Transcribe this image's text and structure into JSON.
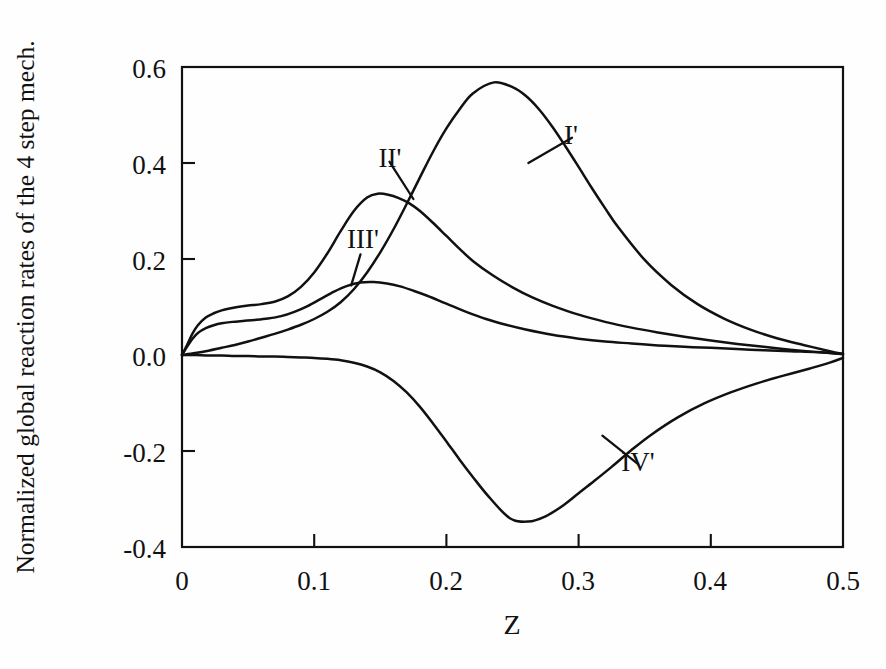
{
  "figure": {
    "background_color": "#fefefe",
    "ink_color": "#111111"
  },
  "axes": {
    "y_title": "Normalized global reaction rates of the 4 step mech.",
    "x_title": "Z",
    "y_ticks": [
      "0.6",
      "0.4",
      "0.2",
      "0.0",
      "-0.2",
      "-0.4"
    ],
    "x_ticks": [
      "0",
      "0.1",
      "0.2",
      "0.3",
      "0.4",
      "0.5"
    ]
  },
  "series_labels": {
    "one": "I'",
    "two": "II'",
    "three": "III'",
    "four": "IV'"
  },
  "chart_data": {
    "type": "line",
    "title": "",
    "subtitle": "",
    "xlabel": "Z",
    "ylabel": "Normalized global reaction rates of the 4 step mech.",
    "xlim": [
      0.0,
      0.5
    ],
    "ylim": [
      -0.4,
      0.6
    ],
    "xticks": [
      0.0,
      0.1,
      0.2,
      0.3,
      0.4,
      0.5
    ],
    "yticks": [
      -0.4,
      -0.2,
      0.0,
      0.2,
      0.4,
      0.6
    ],
    "grid": false,
    "legend": "inline-annotations",
    "annotations": [
      {
        "text": "I'",
        "x": 0.295,
        "y": 0.465,
        "points_to": {
          "x": 0.262,
          "y": 0.4
        }
      },
      {
        "text": "II'",
        "x": 0.157,
        "y": 0.415,
        "points_to": {
          "x": 0.175,
          "y": 0.325
        }
      },
      {
        "text": "III'",
        "x": 0.135,
        "y": 0.222,
        "points_to": {
          "x": 0.128,
          "y": 0.145
        }
      },
      {
        "text": "IV'",
        "x": 0.345,
        "y": -0.215,
        "points_to": {
          "x": 0.318,
          "y": -0.168
        }
      }
    ],
    "series": [
      {
        "name": "I'",
        "peak": {
          "x": 0.236,
          "y": 0.568
        },
        "x": [
          0.0,
          0.01,
          0.02,
          0.03,
          0.04,
          0.05,
          0.06,
          0.07,
          0.08,
          0.09,
          0.1,
          0.11,
          0.12,
          0.13,
          0.14,
          0.15,
          0.16,
          0.17,
          0.18,
          0.19,
          0.2,
          0.21,
          0.22,
          0.236,
          0.25,
          0.26,
          0.27,
          0.28,
          0.29,
          0.3,
          0.31,
          0.32,
          0.33,
          0.35,
          0.37,
          0.39,
          0.41,
          0.43,
          0.45,
          0.47,
          0.49,
          0.5
        ],
        "y": [
          0.0,
          0.004,
          0.009,
          0.015,
          0.021,
          0.028,
          0.036,
          0.044,
          0.053,
          0.063,
          0.075,
          0.09,
          0.11,
          0.137,
          0.172,
          0.214,
          0.262,
          0.315,
          0.37,
          0.424,
          0.472,
          0.512,
          0.545,
          0.568,
          0.558,
          0.54,
          0.512,
          0.476,
          0.435,
          0.392,
          0.348,
          0.306,
          0.266,
          0.198,
          0.146,
          0.106,
          0.076,
          0.053,
          0.035,
          0.021,
          0.008,
          0.002
        ]
      },
      {
        "name": "II'",
        "peak": {
          "x": 0.148,
          "y": 0.336
        },
        "x": [
          0.0,
          0.004,
          0.008,
          0.012,
          0.018,
          0.024,
          0.03,
          0.036,
          0.042,
          0.05,
          0.06,
          0.07,
          0.08,
          0.09,
          0.1,
          0.11,
          0.12,
          0.13,
          0.14,
          0.148,
          0.156,
          0.164,
          0.172,
          0.18,
          0.19,
          0.2,
          0.21,
          0.22,
          0.235,
          0.25,
          0.265,
          0.28,
          0.3,
          0.32,
          0.34,
          0.36,
          0.38,
          0.4,
          0.42,
          0.44,
          0.46,
          0.48,
          0.5
        ],
        "y": [
          0.0,
          0.022,
          0.045,
          0.062,
          0.078,
          0.087,
          0.093,
          0.097,
          0.1,
          0.103,
          0.106,
          0.111,
          0.122,
          0.142,
          0.172,
          0.212,
          0.258,
          0.3,
          0.328,
          0.336,
          0.334,
          0.327,
          0.316,
          0.3,
          0.275,
          0.248,
          0.221,
          0.196,
          0.166,
          0.141,
          0.12,
          0.103,
          0.084,
          0.069,
          0.057,
          0.047,
          0.038,
          0.03,
          0.023,
          0.017,
          0.011,
          0.006,
          0.002
        ]
      },
      {
        "name": "III'",
        "peak": {
          "x": 0.135,
          "y": 0.151
        },
        "x": [
          0.0,
          0.004,
          0.008,
          0.012,
          0.018,
          0.024,
          0.03,
          0.038,
          0.046,
          0.055,
          0.065,
          0.075,
          0.085,
          0.095,
          0.105,
          0.115,
          0.125,
          0.135,
          0.145,
          0.155,
          0.165,
          0.175,
          0.185,
          0.2,
          0.215,
          0.23,
          0.245,
          0.26,
          0.28,
          0.3,
          0.32,
          0.34,
          0.36,
          0.38,
          0.4,
          0.43,
          0.46,
          0.48,
          0.5
        ],
        "y": [
          0.0,
          0.018,
          0.034,
          0.046,
          0.056,
          0.062,
          0.066,
          0.069,
          0.071,
          0.073,
          0.076,
          0.081,
          0.09,
          0.102,
          0.117,
          0.132,
          0.144,
          0.151,
          0.152,
          0.149,
          0.143,
          0.134,
          0.124,
          0.107,
          0.09,
          0.075,
          0.063,
          0.053,
          0.042,
          0.034,
          0.028,
          0.024,
          0.02,
          0.017,
          0.015,
          0.011,
          0.008,
          0.006,
          0.002
        ]
      },
      {
        "name": "IV'",
        "minimum": {
          "x": 0.248,
          "y": -0.347
        },
        "x": [
          0.0,
          0.01,
          0.02,
          0.03,
          0.04,
          0.05,
          0.06,
          0.07,
          0.08,
          0.09,
          0.1,
          0.11,
          0.12,
          0.13,
          0.14,
          0.15,
          0.16,
          0.17,
          0.18,
          0.19,
          0.2,
          0.21,
          0.22,
          0.232,
          0.248,
          0.262,
          0.275,
          0.288,
          0.3,
          0.312,
          0.325,
          0.34,
          0.355,
          0.375,
          0.395,
          0.415,
          0.435,
          0.455,
          0.475,
          0.49,
          0.5
        ],
        "y": [
          0.0,
          0.0,
          -0.001,
          -0.001,
          -0.002,
          -0.002,
          -0.003,
          -0.003,
          -0.004,
          -0.005,
          -0.006,
          -0.008,
          -0.011,
          -0.016,
          -0.024,
          -0.036,
          -0.054,
          -0.078,
          -0.108,
          -0.143,
          -0.18,
          -0.218,
          -0.254,
          -0.295,
          -0.34,
          -0.347,
          -0.336,
          -0.314,
          -0.288,
          -0.262,
          -0.233,
          -0.198,
          -0.166,
          -0.13,
          -0.101,
          -0.078,
          -0.059,
          -0.043,
          -0.028,
          -0.016,
          -0.006
        ]
      }
    ]
  }
}
